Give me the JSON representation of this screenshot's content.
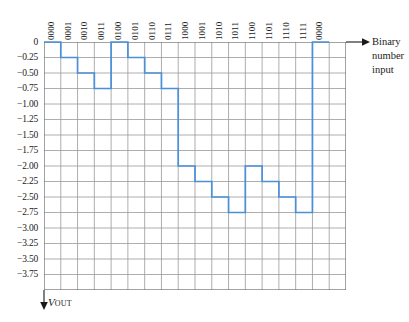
{
  "chart_data": {
    "type": "line",
    "title": "",
    "subtitle": "",
    "xlabel": "Binary\nnumber\ninput",
    "ylabel": "V_OUT",
    "line_style": "step",
    "grid": true,
    "legend": "none",
    "accent_color": "#4a90d9",
    "grid_color": "#999999",
    "axis_color": "#1a1a1a",
    "xlim": [
      0,
      18
    ],
    "ylim": [
      -4.0,
      0
    ],
    "y_tick_labels": [
      "0",
      "−0.25",
      "−0.50",
      "−0.75",
      "−1.00",
      "−1.25",
      "−1.50",
      "−1.75",
      "−2.00",
      "−2.25",
      "−2.50",
      "−2.75",
      "−3.00",
      "−3.25",
      "−3.50",
      "−3.75"
    ],
    "y_tick_values": [
      0,
      -0.25,
      -0.5,
      -0.75,
      -1.0,
      -1.25,
      -1.5,
      -1.75,
      -2.0,
      -2.25,
      -2.5,
      -2.75,
      -3.0,
      -3.25,
      -3.5,
      -3.75
    ],
    "categories": [
      "0000",
      "0001",
      "0010",
      "0011",
      "0100",
      "0101",
      "0110",
      "0111",
      "1000",
      "1001",
      "1010",
      "1011",
      "1100",
      "1101",
      "1110",
      "1111",
      "0000"
    ],
    "values": [
      0,
      -0.25,
      -0.5,
      -0.75,
      0,
      -0.25,
      -0.5,
      -0.75,
      -2.0,
      -2.25,
      -2.5,
      -2.75,
      -2.0,
      -2.25,
      -2.5,
      -2.75,
      0
    ],
    "columns_total": 18,
    "x_grid_divisions": 18,
    "y_grid_divisions": 16,
    "annotations": []
  },
  "axis": {
    "x_title_text": "Binary\nnumber\ninput",
    "y_title_main": "V",
    "y_title_sub": "OUT"
  }
}
